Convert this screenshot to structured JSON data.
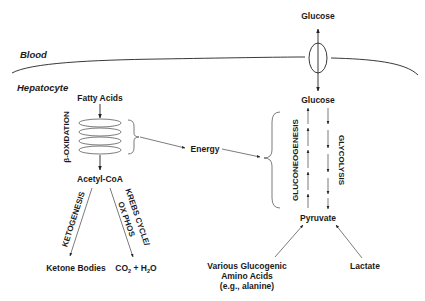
{
  "diagram": {
    "type": "metabolic-pathway",
    "regions": {
      "outside": "Blood",
      "inside": "Hepatocyte"
    },
    "nodes": {
      "glucose_blood": "Glucose",
      "glucose_cell": "Glucose",
      "fatty_acids": "Fatty Acids",
      "acetyl_coa": "Acetyl-CoA",
      "energy": "Energy",
      "pyruvate": "Pyruvate",
      "ketone_bodies": "Ketone Bodies",
      "co2_h2o": {
        "co": "CO",
        "sub2": "2",
        "plus_h": " + H",
        "sub2b": "2",
        "o": "O"
      },
      "amino_acids_line1": "Various  Glucogenic",
      "amino_acids_line2": "Amino Acids",
      "amino_acids_line3": "(e.g., alanine)",
      "lactate": "Lactate"
    },
    "processes": {
      "beta_oxidation": "β-OXIDATION",
      "ketogenesis": "KETOGENESIS",
      "krebs_line1": "KREBS CYCLE/",
      "krebs_line2": "OX PHOS",
      "gluconeogenesis": "GLUCONEOGENESIS",
      "glycolysis": "GLYCOLYSIS"
    },
    "edges": [
      {
        "from": "Glucose (blood)",
        "to": "Glucose (hepatocyte)",
        "bidirectional": true,
        "via": "membrane transporter"
      },
      {
        "from": "Fatty Acids",
        "to": "β-OXIDATION"
      },
      {
        "from": "β-OXIDATION",
        "to": "Acetyl-CoA"
      },
      {
        "from": "β-OXIDATION",
        "to": "Energy"
      },
      {
        "from": "Energy",
        "to": "GLUCONEOGENESIS"
      },
      {
        "from": "Acetyl-CoA",
        "to": "Ketone Bodies",
        "label": "KETOGENESIS"
      },
      {
        "from": "Acetyl-CoA",
        "to": "CO2 + H2O",
        "label": "KREBS CYCLE/ OX PHOS"
      },
      {
        "from": "Pyruvate",
        "to": "Glucose",
        "label": "GLUCONEOGENESIS"
      },
      {
        "from": "Glucose",
        "to": "Pyruvate",
        "label": "GLYCOLYSIS"
      },
      {
        "from": "Various Glucogenic Amino Acids (e.g., alanine)",
        "to": "Pyruvate"
      },
      {
        "from": "Lactate",
        "to": "Pyruvate"
      }
    ],
    "colors": {
      "ink": "#1a1a1a",
      "background": "#ffffff"
    }
  }
}
